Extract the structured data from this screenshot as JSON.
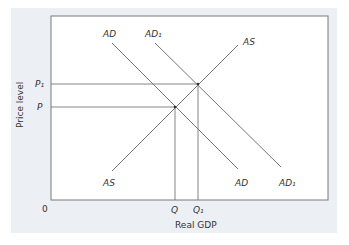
{
  "diagram": {
    "type": "AD-AS shift diagram",
    "axes": {
      "x_label": "Real GDP",
      "y_label": "Price level",
      "origin": "0"
    },
    "curves": {
      "ad": {
        "label_top": "AD",
        "label_bottom": "AD"
      },
      "ad1": {
        "label_top": "AD₁",
        "label_bottom": "AD₁"
      },
      "as": {
        "label_top": "AS",
        "label_bottom": "AS"
      }
    },
    "y_ticks": {
      "p1": "P₁",
      "p": "P"
    },
    "x_ticks": {
      "q": "Q",
      "q1": "Q₁"
    },
    "colors": {
      "panel": "#eceff3",
      "plot": "#ffffff",
      "line": "#555555",
      "border": "#7a7a7a"
    }
  }
}
